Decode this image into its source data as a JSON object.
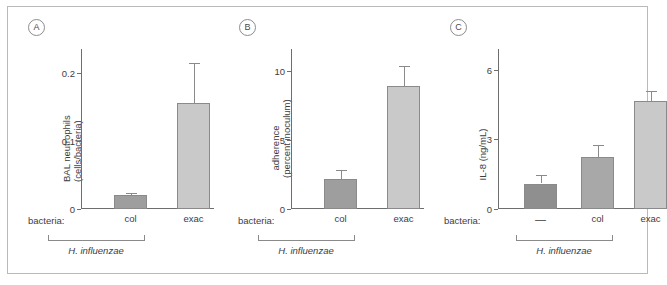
{
  "figure": {
    "border_color": "#b9b9b9",
    "background": "#ffffff"
  },
  "panels": [
    {
      "letter": "A",
      "bacteria_prefix": "bacteria:",
      "group_name": "H. influenzae",
      "ylabel_line1": "BAL neutrophils",
      "ylabel_line2": "(cells/bacteria)",
      "ytick_labels": [
        "0",
        "0.1",
        "0.2"
      ]
    },
    {
      "letter": "B",
      "bacteria_prefix": "bacteria:",
      "group_name": "H. influenzae",
      "ylabel_line1": "adherence",
      "ylabel_line2": "(percent inoculum)",
      "ytick_labels": [
        "0",
        "5",
        "10"
      ]
    },
    {
      "letter": "C",
      "bacteria_prefix": "bacteria:",
      "group_name": "H. influenzae",
      "ylabel_line1": "IL-8 (ng/mL)",
      "ylabel_line2": "",
      "ytick_labels": [
        "0",
        "3",
        "6"
      ]
    }
  ],
  "chart_data": [
    {
      "type": "bar",
      "panel": "A",
      "title": "",
      "xlabel": "bacteria:",
      "ylabel": "BAL neutrophils (cells/bacteria)",
      "categories": [
        "col",
        "exac"
      ],
      "values": [
        0.02,
        0.155
      ],
      "errors": [
        0.004,
        0.06
      ],
      "bar_colors": [
        "#9e9e9e",
        "#c9c9c9"
      ],
      "yticks": [
        0,
        0.1,
        0.2
      ],
      "ylim": [
        0,
        0.235
      ],
      "grid": false,
      "group_label": "H. influenzae",
      "group_members": [
        "col",
        "exac"
      ]
    },
    {
      "type": "bar",
      "panel": "B",
      "title": "",
      "xlabel": "bacteria:",
      "ylabel": "adherence (percent inoculum)",
      "categories": [
        "col",
        "exac"
      ],
      "values": [
        2.2,
        8.9
      ],
      "errors": [
        0.6,
        1.5
      ],
      "bar_colors": [
        "#9e9e9e",
        "#c9c9c9"
      ],
      "yticks": [
        0,
        5,
        10
      ],
      "ylim": [
        0,
        11.6
      ],
      "grid": false,
      "group_label": "H. influenzae",
      "group_members": [
        "col",
        "exac"
      ]
    },
    {
      "type": "bar",
      "panel": "C",
      "title": "",
      "xlabel": "bacteria:",
      "ylabel": "IL-8 (ng/mL)",
      "categories": [
        "—",
        "col",
        "exac"
      ],
      "values": [
        1.1,
        2.25,
        4.65
      ],
      "errors": [
        0.35,
        0.5,
        0.45
      ],
      "bar_colors": [
        "#8f8f8f",
        "#a8a8a8",
        "#c9c9c9"
      ],
      "yticks": [
        0,
        3,
        6
      ],
      "ylim": [
        0,
        6.9
      ],
      "grid": false,
      "group_label": "H. influenzae",
      "group_members": [
        "col",
        "exac"
      ]
    }
  ]
}
